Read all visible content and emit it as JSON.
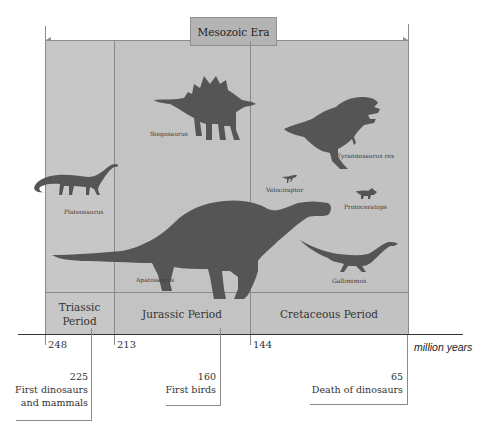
{
  "era": {
    "title": "Mesozoic Era"
  },
  "periods": [
    {
      "name": "Triassic Period",
      "line1": "Triassic",
      "line2": "Period",
      "start": 248
    },
    {
      "name": "Jurassic Period",
      "label": "Jurassic Period",
      "start": 213
    },
    {
      "name": "Cretaceous Period",
      "label": "Cretaceous Period",
      "start": 144
    }
  ],
  "ticks": [
    "248",
    "213",
    "144"
  ],
  "axis_unit": "million years",
  "dinosaurs": {
    "plateosaurus": "Plateosaurus",
    "stegosaurus": "Stegosaurus",
    "apatosaurus": "Apatosaurus",
    "tyrannosaurus": "Tyrannosaurus rex",
    "velociraptor": "Velociraptor",
    "protoceratops": "Protoceratops",
    "gallimimus": "Gallimimus"
  },
  "events": [
    {
      "year": "225",
      "line1": "First dinosaurs",
      "line2": "and mammals"
    },
    {
      "year": "160",
      "line1": "First birds"
    },
    {
      "year": "65",
      "line1": "Death of dinosaurs"
    }
  ],
  "colors": {
    "panel": "#c3c3c3",
    "silhouette": "#555555",
    "era_box": "#b4b4b4",
    "lines": "#8a8a8a"
  }
}
